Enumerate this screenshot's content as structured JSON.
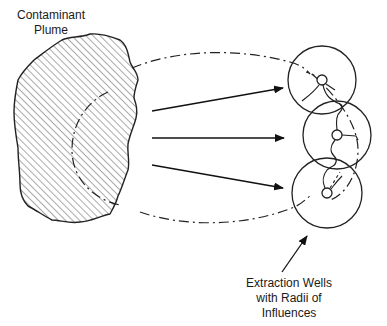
{
  "labels": {
    "plume_line1": "Contaminant",
    "plume_line2": "Plume",
    "wells_line1": "Extraction Wells",
    "wells_line2": "with Radii of",
    "wells_line3": "Influences"
  },
  "colors": {
    "stroke": "#222222",
    "hatch": "#555555",
    "background": "#ffffff"
  },
  "elements": {
    "plume": "hatched irregular polygon",
    "flow_arrows": 3,
    "extraction_wells": 3,
    "capture_zone": "dash-dot boundary"
  }
}
